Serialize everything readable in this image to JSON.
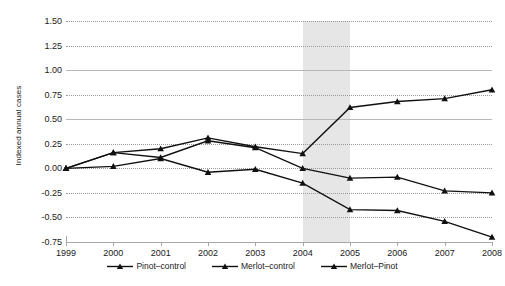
{
  "chart_data": {
    "type": "line",
    "title": "",
    "xlabel": "",
    "ylabel": "Indexed annual cases",
    "categories": [
      "1999",
      "2000",
      "2001",
      "2002",
      "2003",
      "2004",
      "2005",
      "2006",
      "2007",
      "2008"
    ],
    "x": [
      1999,
      2000,
      2001,
      2002,
      2003,
      2004,
      2005,
      2006,
      2007,
      2008
    ],
    "xlim": [
      1999,
      2008
    ],
    "ylim": [
      -0.75,
      1.5
    ],
    "yticks": [
      1.5,
      1.25,
      1.0,
      0.75,
      0.5,
      0.25,
      0.0,
      -0.25,
      -0.5,
      -0.75
    ],
    "ytick_labels": [
      "1.50",
      "1.25",
      "1.00",
      "0.75",
      "0.50",
      "0.25",
      "0.00",
      "-0.25",
      "-0.50",
      "-0.75"
    ],
    "grid": true,
    "grid_style": "dotted",
    "legend_position": "bottom",
    "marker": "triangle",
    "series": [
      {
        "name": "Pinot–control",
        "color": "#101010",
        "values": [
          0.0,
          0.02,
          0.1,
          -0.04,
          -0.01,
          -0.15,
          -0.42,
          -0.43,
          -0.54,
          -0.7
        ]
      },
      {
        "name": "Merlot–control",
        "color": "#101010",
        "values": [
          0.0,
          0.16,
          0.11,
          0.28,
          0.21,
          0.0,
          -0.1,
          -0.09,
          -0.23,
          -0.25
        ]
      },
      {
        "name": "Merlot–Pinot",
        "color": "#101010",
        "values": [
          0.0,
          0.16,
          0.2,
          0.31,
          0.22,
          0.15,
          0.62,
          0.68,
          0.71,
          0.8
        ]
      }
    ],
    "annotations": [
      {
        "type": "vertical-band",
        "name": "highlight-band",
        "x_start": 2004,
        "x_end": 2005,
        "color": "#e6e6e6"
      }
    ]
  },
  "legend": {
    "items": [
      {
        "label": "Pinot–control"
      },
      {
        "label": "Merlot–control"
      },
      {
        "label": "Merlot–Pinot"
      }
    ]
  }
}
